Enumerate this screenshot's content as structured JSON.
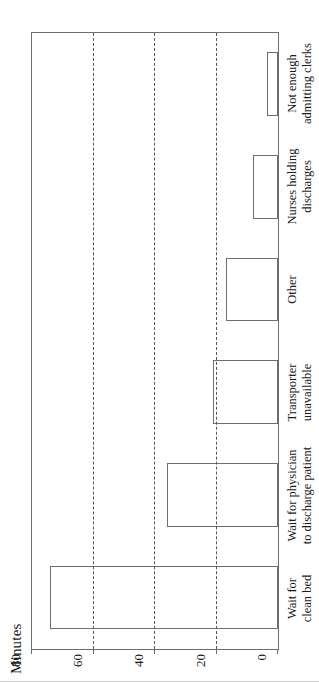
{
  "chart_data": {
    "type": "bar",
    "title": "",
    "xlabel": "",
    "ylabel": "Minutes",
    "ylim": [
      0,
      80
    ],
    "yticks": [
      0,
      20,
      40,
      60,
      80
    ],
    "grid": "dashed horizontal gridlines at 20, 40, 60",
    "legend": "none",
    "orientation": "vertical bars, figure rotated 90 degrees counter-clockwise in the image",
    "categories": [
      "Wait for\nclean bed",
      "Wait for physician\nto discharge patient",
      "Transporter\nunavailable",
      "Other",
      "Nurses holding\ndischarges",
      "Not enough\nadmitting clerks"
    ],
    "category_lines": [
      [
        "Wait for",
        "clean bed"
      ],
      [
        "Wait for physician",
        "to discharge patient"
      ],
      [
        "Transporter",
        "unavailable"
      ],
      [
        "Other"
      ],
      [
        "Nurses holding",
        "discharges"
      ],
      [
        "Not enough",
        "admitting clerks"
      ]
    ],
    "values": [
      74,
      36,
      21,
      17,
      8,
      3.5
    ]
  },
  "colors": {
    "bar_fill": "#ffffff",
    "bar_stroke": "#6e6e6e",
    "axis": "#6e6e6e",
    "gridline": "#555555",
    "text": "#1a1a1a",
    "background": "#ffffff"
  }
}
